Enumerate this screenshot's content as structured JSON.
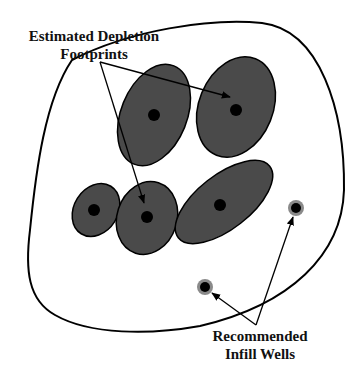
{
  "diagram": {
    "labels": {
      "depletion_line1": "Estimated Depletion",
      "depletion_line2": "Footprints",
      "infill_line1": "Recommended",
      "infill_line2": "Infill Wells"
    },
    "colors": {
      "footprint_fill": "#4a4a4a",
      "well": "#000000",
      "infill_halo": "#8a8a8a",
      "outline": "#000000",
      "background": "#ffffff"
    },
    "footprints": [
      {
        "id": "upper-left",
        "cx": 154,
        "cy": 115,
        "rx": 33,
        "ry": 53,
        "rotate": 22
      },
      {
        "id": "upper-right",
        "cx": 236,
        "cy": 107,
        "rx": 37,
        "ry": 52,
        "rotate": 22
      },
      {
        "id": "small-left",
        "cx": 96,
        "cy": 210,
        "rx": 22,
        "ry": 28,
        "rotate": 32
      },
      {
        "id": "middle",
        "cx": 147,
        "cy": 218,
        "rx": 30,
        "ry": 37,
        "rotate": 18
      },
      {
        "id": "long-right",
        "cx": 224,
        "cy": 202,
        "rx": 27,
        "ry": 58,
        "rotate": 52
      }
    ],
    "existing_wells": [
      {
        "x": 154,
        "y": 115
      },
      {
        "x": 236,
        "y": 110
      },
      {
        "x": 94,
        "y": 210
      },
      {
        "x": 147,
        "y": 217
      },
      {
        "x": 220,
        "y": 205
      }
    ],
    "infill_wells": [
      {
        "x": 296,
        "y": 208
      },
      {
        "x": 205,
        "y": 287
      }
    ]
  }
}
